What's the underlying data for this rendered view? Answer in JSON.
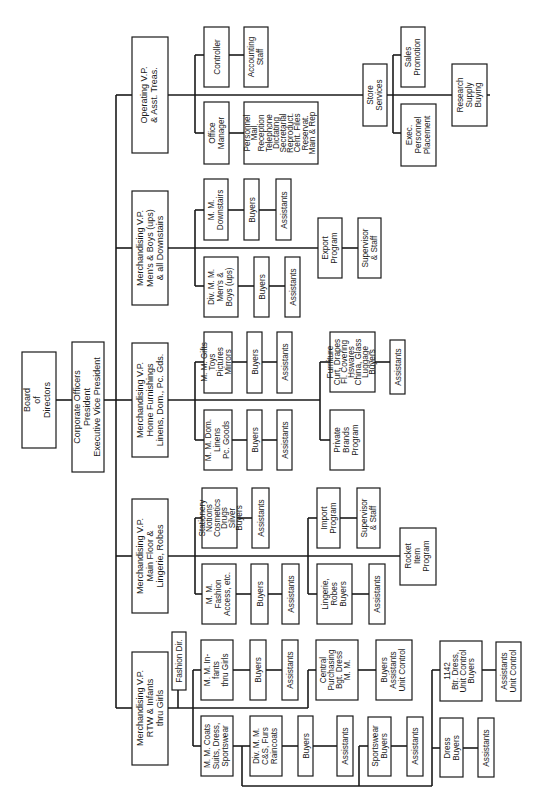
{
  "chart_title": "",
  "orientation": "rotated 90deg counter-clockwise",
  "boxes": {
    "board": {
      "lines": [
        "Board",
        "of",
        "Directors"
      ]
    },
    "corporate": {
      "lines": [
        "Corporate Officers",
        "President",
        "Executive Vice President"
      ]
    },
    "op_vp": {
      "lines": [
        "Operating V.P.",
        "& Asst. Treas."
      ]
    },
    "controller": {
      "lines": [
        "Controller"
      ]
    },
    "accounting": {
      "lines": [
        "Accounting",
        "Staff"
      ]
    },
    "office_mgr": {
      "lines": [
        "Office",
        "Manager"
      ]
    },
    "office_services": {
      "lines": [
        "Personnel",
        "Mail",
        "Reception",
        "Telephone",
        "Dictating",
        "Secretarial",
        "Reproduct.",
        "Cent. Files",
        "Reservat.",
        "Main & Rep"
      ]
    },
    "store_services": {
      "lines": [
        "Store",
        "Services"
      ]
    },
    "sales_promo": {
      "lines": [
        "Sales",
        "Promotion"
      ]
    },
    "exec_personnel": {
      "lines": [
        "Exec.",
        "Personnel",
        "Placement"
      ]
    },
    "research": {
      "lines": [
        "Research",
        "Supply",
        "Buying"
      ]
    },
    "mens_vp": {
      "lines": [
        "Merchandising V.P.",
        "Men's & Boys (ups)",
        "& all Downstairs"
      ]
    },
    "mm_downstairs": {
      "lines": [
        "M. M.",
        "Downstairs"
      ]
    },
    "mm_downstairs_buyers": {
      "lines": [
        "Buyers"
      ]
    },
    "mm_downstairs_assist": {
      "lines": [
        "Assistants"
      ]
    },
    "div_mens": {
      "lines": [
        "Div. M. M.",
        "Men's &",
        "Boys (ups)"
      ]
    },
    "div_mens_buyers": {
      "lines": [
        "Buyers"
      ]
    },
    "div_mens_assist": {
      "lines": [
        "Assistants"
      ]
    },
    "export": {
      "lines": [
        "Export",
        "Program"
      ]
    },
    "export_super": {
      "lines": [
        "Supervisor",
        "& Staff"
      ]
    },
    "home_vp": {
      "lines": [
        "Merchandising V.P.",
        "Home Furnishings",
        "Linens, Dom., Pc. Gds."
      ]
    },
    "mm_gifts": {
      "lines": [
        "M. M. Gifts",
        "Toys",
        "Pictures",
        "Mirrors"
      ]
    },
    "mm_gifts_buyers": {
      "lines": [
        "Buyers"
      ]
    },
    "mm_gifts_assist": {
      "lines": [
        "Assistants"
      ]
    },
    "mm_dom": {
      "lines": [
        "M. M. Dom.",
        "Linens",
        "Pc. Goods"
      ]
    },
    "mm_dom_buyers": {
      "lines": [
        "Buyers"
      ]
    },
    "mm_dom_assist": {
      "lines": [
        "Assistants"
      ]
    },
    "furniture": {
      "lines": [
        "Furniture",
        "Curt, Drapes",
        "Fl. Covering",
        "Hswares",
        "China, Glass",
        "Luggage",
        "Buyers"
      ]
    },
    "furniture_assist": {
      "lines": [
        "Assistants"
      ]
    },
    "private_brands": {
      "lines": [
        "Private",
        "Brands",
        "Program"
      ]
    },
    "main_vp": {
      "lines": [
        "Merchandising V.P.",
        "Main Floor &",
        "Lingerie, Robes"
      ]
    },
    "stationery": {
      "lines": [
        "Stationery",
        "Notions",
        "Cosmetics",
        "Drugs",
        "Silver",
        "Buyers"
      ]
    },
    "stationery_assist": {
      "lines": [
        "Assistants"
      ]
    },
    "mm_fashion": {
      "lines": [
        "M. M.",
        "Fashion",
        "Access, etc."
      ]
    },
    "mm_fashion_buyers": {
      "lines": [
        "Buyers"
      ]
    },
    "mm_fashion_assist": {
      "lines": [
        "Assistants"
      ]
    },
    "import": {
      "lines": [
        "Import",
        "Program"
      ]
    },
    "import_super": {
      "lines": [
        "Supervisor",
        "& Staff"
      ]
    },
    "lingerie": {
      "lines": [
        "Lingerie,",
        "Robes",
        "Buyers"
      ]
    },
    "lingerie_assist": {
      "lines": [
        "Assistants"
      ]
    },
    "rocket": {
      "lines": [
        "Rocket",
        "Item",
        "Program"
      ]
    },
    "rtw_vp": {
      "lines": [
        "Merchandising V.P.",
        "RTW & Infants",
        "thru Girls"
      ]
    },
    "fashion_dir": {
      "lines": [
        "Fashion Dir."
      ]
    },
    "mm_infants": {
      "lines": [
        "M. M. In-",
        "fants",
        "thru Girls"
      ]
    },
    "mm_infants_buyers": {
      "lines": [
        "Buyers"
      ]
    },
    "mm_infants_assist": {
      "lines": [
        "Assistants"
      ]
    },
    "central_purch": {
      "lines": [
        "Central",
        "Purchasing",
        "Bgt. Dress",
        "M. M."
      ]
    },
    "central_purch_staff": {
      "lines": [
        "Buyers",
        "Assistants",
        "Unit Control"
      ]
    },
    "mm_coats": {
      "lines": [
        "M. M. Coats",
        "Suits, Dress,",
        "Sportswear"
      ]
    },
    "div_furs": {
      "lines": [
        "Div. M. M.",
        "C&S, Furs",
        "Raincoats"
      ]
    },
    "div_furs_buyers": {
      "lines": [
        "Buyers"
      ]
    },
    "div_furs_assist": {
      "lines": [
        "Assistants"
      ]
    },
    "sportswear": {
      "lines": [
        "Sportswear",
        "Buyers"
      ]
    },
    "sportswear_assist": {
      "lines": [
        "Assistants"
      ]
    },
    "btr_dress": {
      "lines": [
        "1142",
        "Btr. Dress,",
        "Unit Control",
        "Buyers"
      ]
    },
    "btr_dress_assist": {
      "lines": [
        "Assistants",
        "Unit Control"
      ]
    },
    "dress": {
      "lines": [
        "Dress",
        "Buyers"
      ]
    },
    "dress_assist": {
      "lines": [
        "Assistants"
      ]
    }
  }
}
